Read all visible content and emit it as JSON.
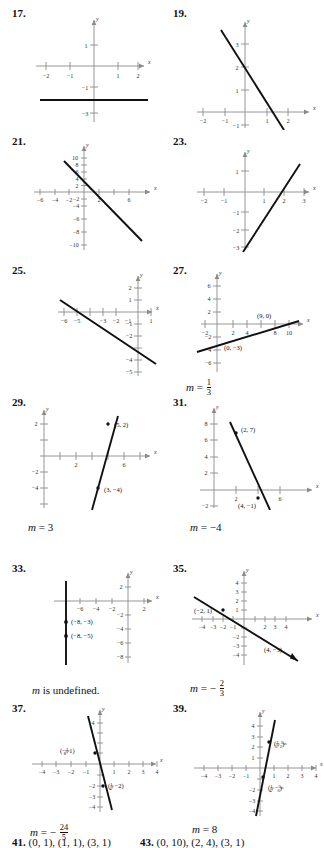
{
  "document": {
    "type": "math-textbook-answer-key-graphs",
    "page_items": [
      {
        "number": "17.",
        "graph": {
          "x_ticks": [
            "-2",
            "-1",
            "1",
            "2"
          ],
          "y_ticks": [
            "1",
            "-1",
            "-3"
          ],
          "axis_labels": {
            "x": "x",
            "y": "y"
          },
          "line": {
            "description": "horizontal line",
            "y_value": -2
          },
          "points": []
        },
        "slope": ""
      },
      {
        "number": "19.",
        "graph": {
          "x_ticks": [
            "-2",
            "-1",
            "1",
            "2"
          ],
          "y_ticks": [
            "3",
            "2",
            "1",
            "-1"
          ],
          "axis_labels": {
            "x": "x",
            "y": "y"
          },
          "line": {
            "description": "decreasing line",
            "y_intercept": 1,
            "slope": -2.5
          },
          "points": []
        },
        "slope": ""
      },
      {
        "number": "21.",
        "graph": {
          "x_ticks": [
            "-6",
            "-4",
            "-2",
            "2",
            "6"
          ],
          "y_ticks": [
            "10",
            "8",
            "6",
            "4",
            "2",
            "-2",
            "-4",
            "-6",
            "-8"
          ],
          "axis_labels": {
            "x": "x",
            "y": "y"
          },
          "line": {
            "description": "decreasing line",
            "y_intercept": 6,
            "slope": -2
          },
          "points": []
        },
        "slope": ""
      },
      {
        "number": "23.",
        "graph": {
          "x_ticks": [
            "-2",
            "-1",
            "1",
            "2",
            "3"
          ],
          "y_ticks": [
            "1",
            "-1",
            "-2",
            "-3"
          ],
          "axis_labels": {
            "x": "x",
            "y": "y"
          },
          "line": {
            "description": "increasing line",
            "y_intercept": -3,
            "slope": 2
          },
          "points": []
        },
        "slope": ""
      },
      {
        "number": "25.",
        "graph": {
          "x_ticks": [
            "-6",
            "-5",
            "-3",
            "-2",
            "-1",
            "1"
          ],
          "y_ticks": [
            "2",
            "1",
            "-1",
            "-2",
            "-4",
            "-5"
          ],
          "axis_labels": {
            "x": "x",
            "y": "y"
          },
          "line": {
            "description": "decreasing line",
            "x_intercept": -5,
            "y_intercept": -2.5,
            "slope": -0.5
          },
          "points": []
        },
        "slope": ""
      },
      {
        "number": "27.",
        "graph": {
          "x_ticks": [
            "-2",
            "2",
            "4",
            "8",
            "10"
          ],
          "y_ticks": [
            "6",
            "4",
            "2",
            "-2",
            "-4",
            "-6"
          ],
          "axis_labels": {
            "x": "x",
            "y": "y"
          },
          "line": {
            "description": "increasing line",
            "y_intercept": -3,
            "slope": 0.3333
          },
          "points": [
            {
              "label": "(9, 0)",
              "x": 9,
              "y": 0
            },
            {
              "label": "(0, −3)",
              "x": 0,
              "y": -3
            }
          ]
        },
        "slope": {
          "variable": "m",
          "equals": "=",
          "value_numerator": "1",
          "value_denominator": "3",
          "is_fraction": true,
          "sign": ""
        }
      },
      {
        "number": "29.",
        "graph": {
          "x_ticks": [
            "2",
            "6"
          ],
          "y_ticks": [
            "2",
            "-2",
            "-4"
          ],
          "axis_labels": {
            "x": "x",
            "y": "y"
          },
          "line": {
            "description": "increasing line",
            "slope": 3
          },
          "points": [
            {
              "label": "(5, 2)",
              "x": 5,
              "y": 2
            },
            {
              "label": "(3, −4)",
              "x": 3,
              "y": -4
            }
          ]
        },
        "slope": {
          "variable": "m",
          "equals": "=",
          "value": "3",
          "is_fraction": false,
          "sign": ""
        }
      },
      {
        "number": "31.",
        "graph": {
          "x_ticks": [
            "2",
            "6"
          ],
          "y_ticks": [
            "8",
            "6",
            "4",
            "2",
            "-2"
          ],
          "axis_labels": {
            "x": "x",
            "y": "y"
          },
          "line": {
            "description": "decreasing line",
            "slope": -4
          },
          "points": [
            {
              "label": "(2, 7)",
              "x": 2,
              "y": 7
            },
            {
              "label": "(4, −1)",
              "x": 4,
              "y": -1
            }
          ]
        },
        "slope": {
          "variable": "m",
          "equals": "=",
          "value": "−4",
          "is_fraction": false,
          "sign": ""
        }
      },
      {
        "number": "33.",
        "graph": {
          "x_ticks": [
            "-6",
            "-4",
            "-2",
            "2"
          ],
          "y_ticks": [
            "2",
            "-2",
            "-4",
            "-6",
            "-8"
          ],
          "axis_labels": {
            "x": "x",
            "y": "y"
          },
          "line": {
            "description": "vertical line",
            "x_value": -8
          },
          "points": [
            {
              "label": "(−8, −3)",
              "x": -8,
              "y": -3
            },
            {
              "label": "(−8, −5)",
              "x": -8,
              "y": -5
            }
          ]
        },
        "slope": {
          "variable": "m",
          "text": "is undefined.",
          "is_fraction": false
        }
      },
      {
        "number": "35.",
        "graph": {
          "x_ticks": [
            "-4",
            "-3",
            "-2",
            "-1",
            "2",
            "3",
            "4"
          ],
          "y_ticks": [
            "4",
            "3",
            "2",
            "1",
            "-2",
            "-3",
            "-4"
          ],
          "axis_labels": {
            "x": "x",
            "y": "y"
          },
          "line": {
            "description": "decreasing line",
            "slope": -0.6667
          },
          "points": [
            {
              "label": "(−2, 1)",
              "x": -2,
              "y": 1
            },
            {
              "label": "(4, −3)",
              "x": 4,
              "y": -3
            }
          ]
        },
        "slope": {
          "variable": "m",
          "equals": "=",
          "value_numerator": "2",
          "value_denominator": "3",
          "is_fraction": true,
          "sign": "−"
        }
      },
      {
        "number": "37.",
        "graph": {
          "x_ticks": [
            "-4",
            "-3",
            "-2",
            "-1",
            "1",
            "2",
            "3",
            "4"
          ],
          "y_ticks": [
            "4",
            "-2",
            "-3",
            "-4"
          ],
          "axis_labels": {
            "x": "x",
            "y": "y"
          },
          "line": {
            "description": "steep decreasing line",
            "slope": -4.8
          },
          "points": [
            {
              "label": "(−3/8, 1)",
              "x": -0.375,
              "y": 1,
              "label_parts": {
                "pre": "(−",
                "num": "3",
                "den": "8",
                "post": ", 1)"
              }
            },
            {
              "label": "(1/4, −2)",
              "x": 0.25,
              "y": -2,
              "label_parts": {
                "pre": "(",
                "num": "1",
                "den": "4",
                "post": ", −2)"
              }
            }
          ]
        },
        "slope": {
          "variable": "m",
          "equals": "=",
          "value_numerator": "24",
          "value_denominator": "5",
          "is_fraction": true,
          "sign": "−"
        }
      },
      {
        "number": "39.",
        "graph": {
          "x_ticks": [
            "-4",
            "-3",
            "-2",
            "-1",
            "1",
            "2",
            "3",
            "4"
          ],
          "y_ticks": [
            "4",
            "3",
            "2",
            "1",
            "-2",
            "-3",
            "-4"
          ],
          "axis_labels": {
            "x": "x",
            "y": "y"
          },
          "line": {
            "description": "steep increasing line",
            "slope": 8
          },
          "points": [
            {
              "label": "(2/3, 5/2)",
              "x": 0.6667,
              "y": 2.5,
              "label_parts": {
                "pre": "(",
                "num": "2",
                "den": "3",
                "mid": ", ",
                "num2": "5",
                "den2": "2",
                "post": ")"
              }
            },
            {
              "label": "(1/4, −5/6)",
              "x": 0.25,
              "y": -0.8333,
              "label_parts": {
                "pre": "(",
                "num": "1",
                "den": "4",
                "mid": ", −",
                "num2": "5",
                "den2": "6",
                "post": ")"
              }
            }
          ]
        },
        "slope": {
          "variable": "m",
          "equals": "=",
          "value": "8",
          "is_fraction": false,
          "sign": ""
        }
      }
    ],
    "bottom_row": [
      {
        "number": "41.",
        "answer": "(0, 1), (1, 1), (3, 1)"
      },
      {
        "number": "43.",
        "answer": "(0, 10), (2, 4), (3, 1)"
      }
    ],
    "colors": {
      "ink": "#111111",
      "axis": "#8a8a8a",
      "line": "#111111"
    }
  }
}
